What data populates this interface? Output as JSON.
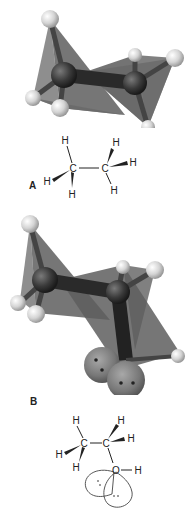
{
  "figure": {
    "panels": [
      {
        "label": "A",
        "molecule": "ethane",
        "model": "ball-and-stick with tetrahedral planes",
        "structure": {
          "atoms": {
            "c1": "C",
            "c2": "C",
            "h": "H"
          },
          "lewis_atoms": [
            "H",
            "H",
            "H",
            "C",
            "C",
            "H",
            "H",
            "H"
          ]
        }
      },
      {
        "label": "B",
        "molecule": "ethanol",
        "model": "ball-and-stick with tetrahedral planes and oxygen lone-pair orbitals",
        "structure": {
          "atoms": {
            "c1": "C",
            "c2": "C",
            "o": "O",
            "h": "H"
          },
          "lone_pairs": [
            ":",
            ".."
          ]
        }
      }
    ],
    "colors": {
      "plane": "#6e6e6e",
      "carbon": "#3a3a3a",
      "hydrogen": "#d9d9d9",
      "oxygen": "#8a8a8a",
      "line": "#222222"
    }
  }
}
